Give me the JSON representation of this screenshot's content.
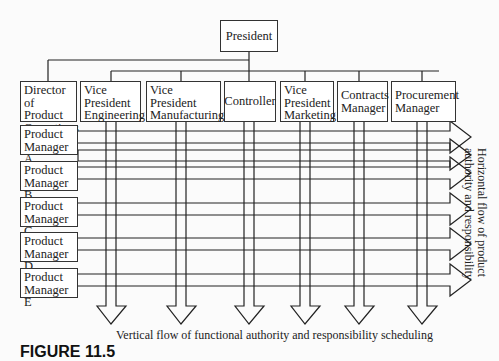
{
  "top": {
    "president": "President"
  },
  "functions": [
    {
      "id": "director",
      "lines": [
        "Director",
        "of Product",
        "Operations"
      ]
    },
    {
      "id": "vp-engineering",
      "lines": [
        "Vice",
        "President",
        "Engineering"
      ]
    },
    {
      "id": "vp-manufacturing",
      "lines": [
        "Vice",
        "President",
        "Manufacturing"
      ]
    },
    {
      "id": "controller",
      "lines": [
        "Controller"
      ]
    },
    {
      "id": "vp-marketing",
      "lines": [
        "Vice",
        "President",
        "Marketing"
      ]
    },
    {
      "id": "contracts",
      "lines": [
        "Contracts",
        "Manager"
      ]
    },
    {
      "id": "procurement",
      "lines": [
        "Procurement",
        "Manager"
      ]
    }
  ],
  "product_managers": [
    {
      "line1": "Product",
      "line2": "Manager A"
    },
    {
      "line1": "Product",
      "line2": "Manager B"
    },
    {
      "line1": "Product",
      "line2": "Manager C"
    },
    {
      "line1": "Product",
      "line2": "Manager D"
    },
    {
      "line1": "Product",
      "line2": "Manager E"
    }
  ],
  "labels": {
    "vertical_flow": "Vertical flow of functional authority and responsibility scheduling",
    "horizontal_flow_line1": "Horizontal flow of product",
    "horizontal_flow_line2": "authority and responsibility",
    "figure_caption": "FIGURE 11.5"
  }
}
